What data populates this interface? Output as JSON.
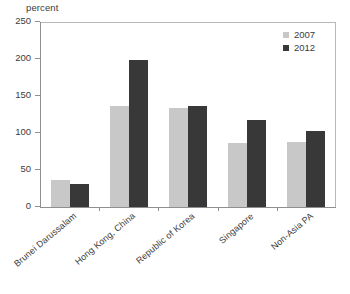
{
  "chart_data": {
    "type": "bar",
    "title": "",
    "subtitle": "",
    "xlabel": "",
    "ylabel": "percent",
    "ylim": [
      0,
      250
    ],
    "yticks": [
      0,
      50,
      100,
      150,
      200,
      250
    ],
    "grid": false,
    "legend_position": "top-right",
    "categories": [
      "Brunei Darussalam",
      "Hong Kong, China",
      "Republic of Korea",
      "Singapore",
      "Non-Asia PA"
    ],
    "series": [
      {
        "name": "2007",
        "color": "#c8c8c8",
        "values": [
          37,
          136,
          134,
          86,
          88
        ]
      },
      {
        "name": "2012",
        "color": "#383838",
        "values": [
          31,
          198,
          137,
          117,
          103
        ]
      }
    ]
  }
}
